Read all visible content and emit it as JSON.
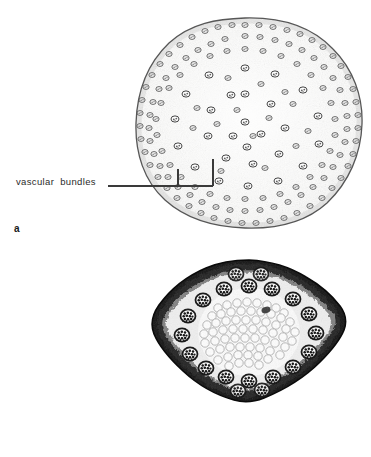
{
  "figure": {
    "background_color": "#ffffff",
    "ink_color": "#2b2b2b",
    "width": 371,
    "height": 457,
    "type": "botanical-micrograph-plate",
    "caption_present": false
  },
  "panels": [
    {
      "key": "a",
      "letter": "a",
      "letter_style": "bold-lowercase",
      "specimen": {
        "name": "monocot-stem-cross-section-scattered",
        "outline_shape": "irregular-rounded-polygon",
        "rendering": "line-drawing",
        "tone": "light-stipple-grey",
        "bundle_arrangement": "scattered-throughout-ground-tissue",
        "bundle_density": "dense-at-periphery-sparse-at-centre",
        "bundle_count_approx": 210,
        "epidermis": "thin-dark-outline"
      },
      "annotation": {
        "label": "vascular bundles",
        "label_word_1": "vascular",
        "label_word_2": "bundles",
        "leader_style": "horizontal-line-with-double-riser-bracket",
        "bracket_direction": "down",
        "pointer_targets": 2
      }
    },
    {
      "key": "b",
      "letter": "b",
      "letter_style": "bold-lowercase",
      "specimen": {
        "name": "stem-cross-section-ring-arranged",
        "outline_shape": "rhomboid-diamond",
        "rendering": "photomicrograph-halftone",
        "tone": "high-contrast-black-and-white",
        "bundle_arrangement": "single-ring-near-periphery",
        "bundle_density": "peripheral-ring",
        "bundle_count_approx": 20,
        "pith": "large-pale-parenchyma-cells",
        "cortex": "dark-sclerenchyma-band"
      },
      "annotation": {
        "label": "vascular bundles",
        "label_word_1": "vascular",
        "label_word_2": "bundles",
        "leader_style": "horizontal-line-with-riser-bracket",
        "bracket_direction": "up",
        "pointer_targets": 2
      }
    }
  ]
}
